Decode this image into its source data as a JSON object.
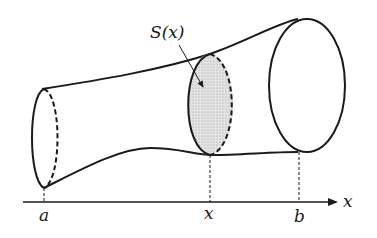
{
  "diagram": {
    "labels": {
      "section": "S(x)",
      "a": "a",
      "x_mark": "x",
      "b": "b",
      "axis": "x"
    },
    "colors": {
      "stroke": "#1a1a1a",
      "section_fill": "#d6d6d6",
      "background": "#ffffff"
    }
  }
}
